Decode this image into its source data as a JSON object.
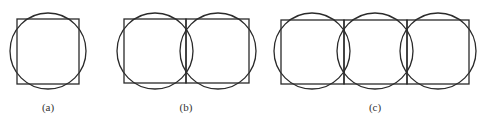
{
  "diagram": {
    "stroke_color": "#2a2a2a",
    "panels": [
      {
        "label": "(a)",
        "squares": [
          {
            "x": 17,
            "y": 19,
            "w": 62,
            "h": 65
          }
        ],
        "circles": [
          {
            "cx": 48,
            "cy": 51,
            "r": 38
          }
        ],
        "label_pos": {
          "x": 48,
          "y": 111
        }
      },
      {
        "label": "(b)",
        "squares": [
          {
            "x": 124,
            "y": 19,
            "w": 62,
            "h": 64
          },
          {
            "x": 186,
            "y": 19,
            "w": 63,
            "h": 64
          }
        ],
        "circles": [
          {
            "cx": 155,
            "cy": 51,
            "r": 38
          },
          {
            "cx": 218,
            "cy": 51,
            "r": 38
          }
        ],
        "label_pos": {
          "x": 186,
          "y": 111
        }
      },
      {
        "label": "(c)",
        "squares": [
          {
            "x": 281,
            "y": 20,
            "w": 63,
            "h": 64
          },
          {
            "x": 344,
            "y": 20,
            "w": 63,
            "h": 64
          },
          {
            "x": 407,
            "y": 20,
            "w": 62,
            "h": 64
          }
        ],
        "circles": [
          {
            "cx": 312,
            "cy": 51,
            "r": 38
          },
          {
            "cx": 375,
            "cy": 51,
            "r": 38
          },
          {
            "cx": 438,
            "cy": 51,
            "r": 38
          }
        ],
        "label_pos": {
          "x": 375,
          "y": 111
        }
      }
    ]
  }
}
